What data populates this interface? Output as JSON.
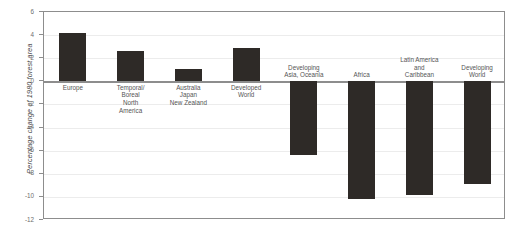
{
  "chart_data": {
    "type": "bar",
    "title": "",
    "xlabel": "",
    "ylabel": "Percentage change of 1980 forest area",
    "ylim": [
      -12,
      6
    ],
    "ytick_step": 2,
    "yticks": [
      6,
      4,
      2,
      0,
      -2,
      -4,
      -6,
      -8,
      -10,
      -12
    ],
    "ytick_labels": [
      "6",
      "4",
      "2",
      "0",
      "-2",
      "-4",
      "-6",
      "-8",
      "-10",
      "-12"
    ],
    "grid": true,
    "legend": "none",
    "bar_color": "#2e2a27",
    "categories": [
      "Europe",
      "Temporal/\nBoreal\nNorth\nAmerica",
      "Australia\nJapan\nNew Zealand",
      "Developed\nWorld",
      "Developing\nAsia, Oceania",
      "Africa",
      "Latin America\nand\nCaribbean",
      "Developing\nWorld"
    ],
    "values": [
      4.2,
      2.65,
      1.1,
      2.85,
      -6.4,
      -10.2,
      -9.8,
      -8.9
    ],
    "value_signs": [
      "positive",
      "positive",
      "positive",
      "positive",
      "negative",
      "negative",
      "negative",
      "negative"
    ]
  },
  "figure": {
    "frame_color": "#8d8d8d",
    "background": "#ffffff"
  }
}
